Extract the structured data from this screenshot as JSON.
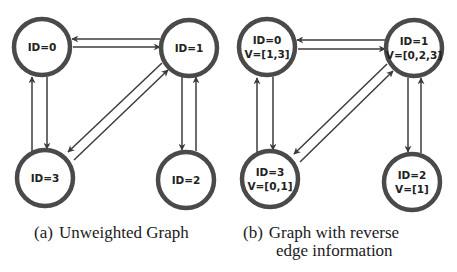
{
  "colors": {
    "node_stroke": "#4a4a4a",
    "edge": "#3c3c3c",
    "text": "#222222",
    "background": "#ffffff"
  },
  "panels": [
    {
      "id": "a",
      "caption_tag": "(a)",
      "caption_line1": "Unweighted Graph",
      "caption_line2": "",
      "nodes": [
        {
          "id": 0,
          "label": "ID=0",
          "sublabel": "",
          "cx": 42,
          "cy": 47
        },
        {
          "id": 1,
          "label": "ID=1",
          "sublabel": "",
          "cx": 189,
          "cy": 48
        },
        {
          "id": 2,
          "label": "ID=2",
          "sublabel": "",
          "cx": 186,
          "cy": 180
        },
        {
          "id": 3,
          "label": "ID=3",
          "sublabel": "",
          "cx": 45,
          "cy": 178
        }
      ],
      "edges": [
        {
          "from": 1,
          "to": 0,
          "x1": 160,
          "y1": 39,
          "x2": 72,
          "y2": 39
        },
        {
          "from": 0,
          "to": 1,
          "x1": 73,
          "y1": 47,
          "x2": 160,
          "y2": 47
        },
        {
          "from": 0,
          "to": 3,
          "x1": 47,
          "y1": 77,
          "x2": 47,
          "y2": 149
        },
        {
          "from": 3,
          "to": 0,
          "x1": 32,
          "y1": 153,
          "x2": 32,
          "y2": 77
        },
        {
          "from": 1,
          "to": 2,
          "x1": 182,
          "y1": 77,
          "x2": 182,
          "y2": 150
        },
        {
          "from": 2,
          "to": 1,
          "x1": 196,
          "y1": 151,
          "x2": 196,
          "y2": 77
        },
        {
          "from": 1,
          "to": 3,
          "x1": 162,
          "y1": 63,
          "x2": 68,
          "y2": 152
        },
        {
          "from": 3,
          "to": 1,
          "x1": 74,
          "y1": 160,
          "x2": 168,
          "y2": 70
        }
      ]
    },
    {
      "id": "b",
      "caption_tag": "(b)",
      "caption_line1": "Graph with reverse",
      "caption_line2": "edge information",
      "nodes": [
        {
          "id": 0,
          "label": "ID=0",
          "sublabel": "V=[1,3]",
          "cx": 267,
          "cy": 47
        },
        {
          "id": 1,
          "label": "ID=1",
          "sublabel": "V=[0,2,3]",
          "cx": 414,
          "cy": 48
        },
        {
          "id": 2,
          "label": "ID=2",
          "sublabel": "V=[1]",
          "cx": 412,
          "cy": 182
        },
        {
          "id": 3,
          "label": "ID=3",
          "sublabel": "V=[0,1]",
          "cx": 270,
          "cy": 179
        }
      ],
      "edges": [
        {
          "from": 1,
          "to": 0,
          "x1": 385,
          "y1": 40,
          "x2": 297,
          "y2": 40
        },
        {
          "from": 0,
          "to": 1,
          "x1": 298,
          "y1": 49,
          "x2": 385,
          "y2": 49
        },
        {
          "from": 0,
          "to": 3,
          "x1": 273,
          "y1": 77,
          "x2": 273,
          "y2": 150
        },
        {
          "from": 3,
          "to": 0,
          "x1": 257,
          "y1": 154,
          "x2": 257,
          "y2": 78
        },
        {
          "from": 1,
          "to": 2,
          "x1": 408,
          "y1": 78,
          "x2": 408,
          "y2": 152
        },
        {
          "from": 2,
          "to": 1,
          "x1": 421,
          "y1": 153,
          "x2": 421,
          "y2": 78
        },
        {
          "from": 1,
          "to": 3,
          "x1": 387,
          "y1": 64,
          "x2": 294,
          "y2": 154
        },
        {
          "from": 3,
          "to": 1,
          "x1": 300,
          "y1": 162,
          "x2": 393,
          "y2": 71
        }
      ]
    }
  ]
}
